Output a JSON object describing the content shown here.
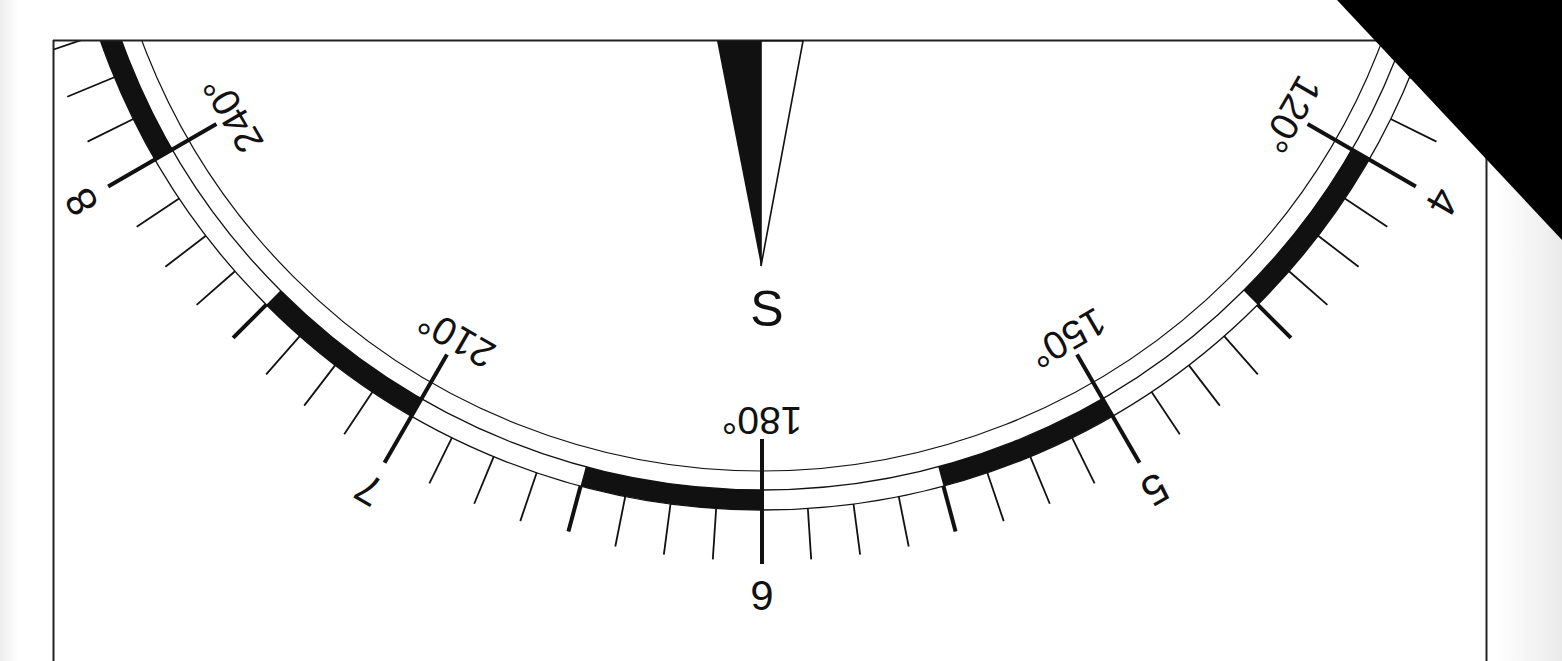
{
  "dial": {
    "title_letter": "S",
    "orientation": "upside-down",
    "ink_color": "#111111",
    "paper_color": "#ffffff",
    "corner_mask_color": "#000000",
    "degree_labels": [
      {
        "azimuth": 120,
        "text": "120°"
      },
      {
        "azimuth": 150,
        "text": "150°"
      },
      {
        "azimuth": 180,
        "text": "180°"
      },
      {
        "azimuth": 210,
        "text": "210°"
      },
      {
        "azimuth": 240,
        "text": "240°"
      }
    ],
    "hour_labels": [
      {
        "azimuth": 120,
        "text": "4"
      },
      {
        "azimuth": 150,
        "text": "5"
      },
      {
        "azimuth": 180,
        "text": "6"
      },
      {
        "azimuth": 210,
        "text": "7"
      },
      {
        "azimuth": 240,
        "text": "8"
      }
    ],
    "scale": {
      "visible_azimuth_range": [
        90,
        270
      ],
      "degrees_per_hour": 30,
      "minor_tick_step_deg": 3.75,
      "half_hour_tick_step_deg": 15,
      "major_tick_step_deg": 30,
      "band_segment_deg": 15,
      "band_black_starts_at_multiples_of_deg": 30
    },
    "needle": {
      "points_to": "S",
      "azimuth": 180,
      "left_half": "filled",
      "right_half": "outline"
    }
  }
}
